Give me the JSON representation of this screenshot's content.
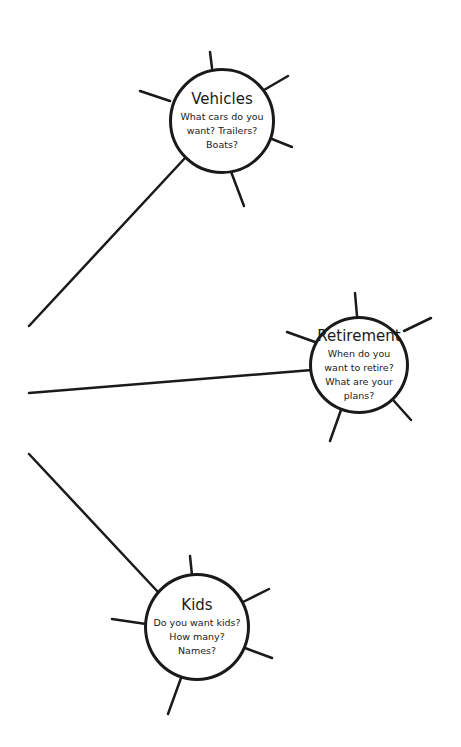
{
  "diagram": {
    "type": "mind-map",
    "colors": {
      "stroke": "#1a1a1a",
      "background": "#ffffff"
    },
    "nodes": [
      {
        "id": "vehicles",
        "title": "Vehicles",
        "body": "What cars do you want? Trailers? Boats?"
      },
      {
        "id": "retirement",
        "title": "Retirement",
        "body": "When do you want to retire? What are your plans?"
      },
      {
        "id": "kids",
        "title": "Kids",
        "body": "Do you want kids? How many? Names?"
      }
    ],
    "connectors": [
      {
        "from": "left-edge",
        "to": "vehicles"
      },
      {
        "from": "left-edge",
        "to": "retirement"
      },
      {
        "from": "left-edge",
        "to": "kids"
      }
    ]
  }
}
